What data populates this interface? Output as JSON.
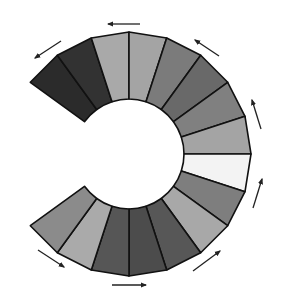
{
  "diagram": {
    "type": "segmented-ring",
    "center": [
      129,
      154
    ],
    "inner_radius": 55,
    "outer_radius": 122,
    "start_angle_deg": 144,
    "segment_span_deg": 18,
    "stroke_color": "#111111",
    "segments": [
      {
        "index": 1,
        "from": 144,
        "to": 126,
        "fill": "#2b2b2b"
      },
      {
        "index": 2,
        "from": 126,
        "to": 108,
        "fill": "#323232"
      },
      {
        "index": 3,
        "from": 108,
        "to": 90,
        "fill": "#a9a9a9"
      },
      {
        "index": 4,
        "from": 90,
        "to": 72,
        "fill": "#a4a4a4"
      },
      {
        "index": 5,
        "from": 72,
        "to": 54,
        "fill": "#7b7b7b"
      },
      {
        "index": 6,
        "from": 54,
        "to": 36,
        "fill": "#696969"
      },
      {
        "index": 7,
        "from": 36,
        "to": 18,
        "fill": "#808080"
      },
      {
        "index": 8,
        "from": 18,
        "to": 0,
        "fill": "#a4a4a4"
      },
      {
        "index": 9,
        "from": 0,
        "to": -18,
        "fill": "#f3f3f3"
      },
      {
        "index": 10,
        "from": -18,
        "to": -36,
        "fill": "#7e7e7e"
      },
      {
        "index": 11,
        "from": -36,
        "to": -54,
        "fill": "#a8a8a8"
      },
      {
        "index": 12,
        "from": -54,
        "to": -72,
        "fill": "#575757"
      },
      {
        "index": 13,
        "from": -72,
        "to": -90,
        "fill": "#4c4c4c"
      },
      {
        "index": 14,
        "from": -90,
        "to": -108,
        "fill": "#565656"
      },
      {
        "index": 15,
        "from": -108,
        "to": -126,
        "fill": "#aaaaaa"
      },
      {
        "index": 16,
        "from": -126,
        "to": -144,
        "fill": "#8b8b8b"
      }
    ],
    "arrows": [
      {
        "name": "arrow-top",
        "from": [
          140,
          24
        ],
        "to": [
          108,
          24
        ],
        "direction": "left"
      },
      {
        "name": "arrow-top-left",
        "from": [
          61,
          41
        ],
        "to": [
          35,
          58
        ],
        "direction": "down-left"
      },
      {
        "name": "arrow-top-right",
        "from": [
          219,
          56
        ],
        "to": [
          195,
          40
        ],
        "direction": "up-left"
      },
      {
        "name": "arrow-right-upper",
        "from": [
          261,
          129
        ],
        "to": [
          252,
          100
        ],
        "direction": "up"
      },
      {
        "name": "arrow-right-lower",
        "from": [
          253,
          208
        ],
        "to": [
          262,
          179
        ],
        "direction": "up"
      },
      {
        "name": "arrow-bottom-right",
        "from": [
          193,
          271
        ],
        "to": [
          220,
          251
        ],
        "direction": "up-right"
      },
      {
        "name": "arrow-bottom",
        "from": [
          112,
          285
        ],
        "to": [
          146,
          285
        ],
        "direction": "right"
      },
      {
        "name": "arrow-bottom-left",
        "from": [
          38,
          250
        ],
        "to": [
          64,
          267
        ],
        "direction": "down-right"
      }
    ],
    "arrow_color": "#222222"
  }
}
